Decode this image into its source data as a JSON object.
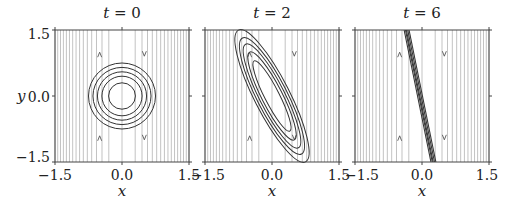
{
  "chart_data": [
    {
      "type": "line",
      "title": "t = 0",
      "t": 0,
      "xlabel": "x",
      "ylabel": "y",
      "xlim": [
        -1.5,
        1.5
      ],
      "ylim": [
        -1.5,
        1.5
      ],
      "xticks": [
        "-1.5",
        "0.0",
        "1.5"
      ],
      "yticks": [
        "1.5",
        "0.0",
        "-1.5"
      ],
      "background": "vertical streamlines (shear flow), denser toward |x| large",
      "contours": {
        "shape": "concentric circles",
        "center": [
          0.0,
          0.0
        ],
        "radii": [
          0.3,
          0.45,
          0.55,
          0.65,
          0.75
        ]
      },
      "arrows": [
        {
          "x": -0.5,
          "direction": "up"
        },
        {
          "x": 0.5,
          "direction": "down"
        }
      ]
    },
    {
      "type": "line",
      "title": "t = 2",
      "t": 2,
      "xlabel": "x",
      "ylabel": "",
      "xlim": [
        -1.5,
        1.5
      ],
      "ylim": [
        -1.5,
        1.5
      ],
      "xticks": [
        "-1.5",
        "0.0",
        "1.5"
      ],
      "contours": {
        "shape": "sheared ellipses",
        "center": [
          0.0,
          0.0
        ],
        "orientation": "tilted, top-left to bottom-right"
      },
      "arrows": [
        {
          "x": -0.5,
          "direction": "up"
        },
        {
          "x": 0.5,
          "direction": "down"
        }
      ]
    },
    {
      "type": "line",
      "title": "t = 6",
      "t": 6,
      "xlabel": "x",
      "ylabel": "",
      "xlim": [
        -1.5,
        1.5
      ],
      "ylim": [
        -1.5,
        1.5
      ],
      "xticks": [
        "-1.5",
        "0.0",
        "1.5"
      ],
      "contours": {
        "shape": "highly elongated thin band",
        "from": [
          -0.35,
          1.5
        ],
        "to": [
          0.25,
          -1.5
        ]
      },
      "arrows": [
        {
          "x": -0.5,
          "direction": "up"
        },
        {
          "x": 0.5,
          "direction": "down"
        }
      ]
    }
  ],
  "panels": [
    {
      "title_var": "t",
      "title_eq": " = ",
      "title_val": "0",
      "xtick_left": "−1.5",
      "xtick_mid": "0.0",
      "xtick_right": "1.5",
      "xlabel": "x"
    },
    {
      "title_var": "t",
      "title_eq": " = ",
      "title_val": "2",
      "xtick_left": "−1.5",
      "xtick_mid": "0.0",
      "xtick_right": "1.5",
      "xlabel": "x"
    },
    {
      "title_var": "t",
      "title_eq": " = ",
      "title_val": "6",
      "xtick_left": "−1.5",
      "xtick_mid": "0.0",
      "xtick_right": "1.5",
      "xlabel": "x"
    }
  ],
  "yaxis": {
    "label": "y",
    "ticks": [
      "1.5",
      "0.0",
      "−1.5"
    ]
  },
  "colors": {
    "stream": "#9a9a9a",
    "contour": "#333333",
    "frame": "#444444"
  }
}
